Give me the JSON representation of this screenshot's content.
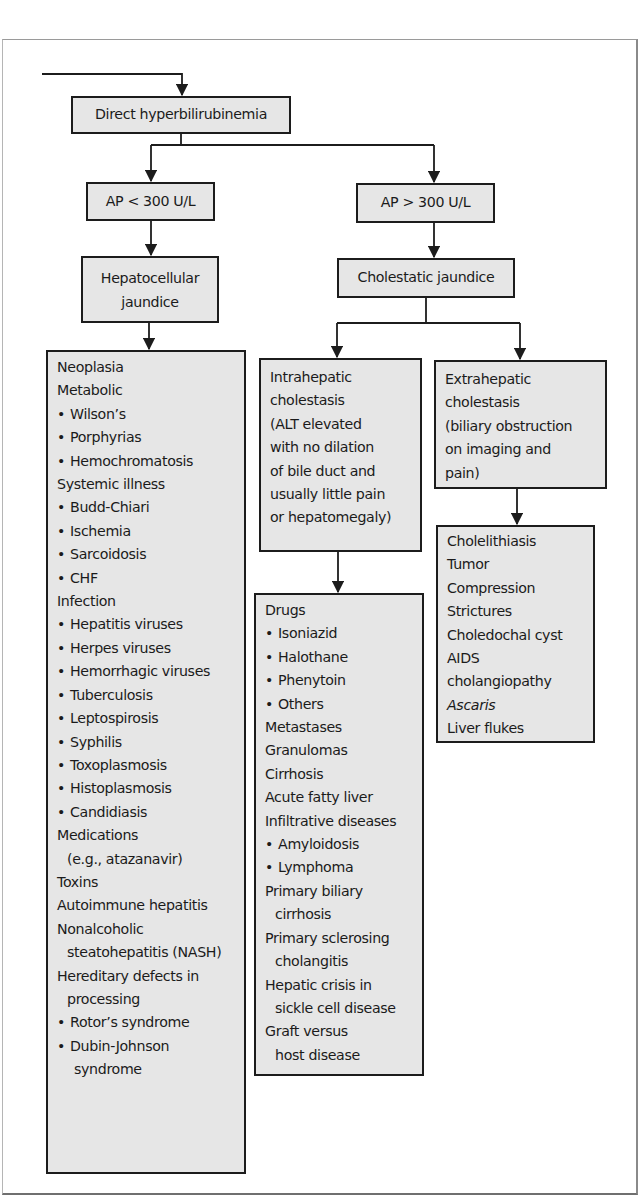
{
  "diagram": {
    "type": "flowchart",
    "root": {
      "label": "Direct hyperbilirubinemia"
    },
    "branches": [
      {
        "condition": "AP < 300 U/L",
        "result": "Hepatocellular jaundice",
        "result_lines": [
          "Hepatocellular",
          "jaundice"
        ],
        "causes": [
          {
            "text": "Neoplasia",
            "style": "heading"
          },
          {
            "text": "Metabolic",
            "style": "heading"
          },
          {
            "text": "Wilson’s",
            "style": "bullet"
          },
          {
            "text": "Porphyrias",
            "style": "bullet"
          },
          {
            "text": "Hemochromatosis",
            "style": "bullet"
          },
          {
            "text": "Systemic illness",
            "style": "heading"
          },
          {
            "text": "Budd-Chiari",
            "style": "bullet"
          },
          {
            "text": "Ischemia",
            "style": "bullet"
          },
          {
            "text": "Sarcoidosis",
            "style": "bullet"
          },
          {
            "text": "CHF",
            "style": "bullet"
          },
          {
            "text": "Infection",
            "style": "heading"
          },
          {
            "text": "Hepatitis viruses",
            "style": "bullet"
          },
          {
            "text": "Herpes viruses",
            "style": "bullet"
          },
          {
            "text": "Hemorrhagic viruses",
            "style": "bullet"
          },
          {
            "text": "Tuberculosis",
            "style": "bullet"
          },
          {
            "text": "Leptospirosis",
            "style": "bullet"
          },
          {
            "text": "Syphilis",
            "style": "bullet"
          },
          {
            "text": "Toxoplasmosis",
            "style": "bullet"
          },
          {
            "text": "Histoplasmosis",
            "style": "bullet"
          },
          {
            "text": "Candidiasis",
            "style": "bullet"
          },
          {
            "text": "Medications",
            "style": "heading"
          },
          {
            "text": "(e.g., atazanavir)",
            "style": "indent"
          },
          {
            "text": "Toxins",
            "style": "heading"
          },
          {
            "text": "Autoimmune hepatitis",
            "style": "heading"
          },
          {
            "text": "Nonalcoholic",
            "style": "heading"
          },
          {
            "text": "steatohepatitis (NASH)",
            "style": "indent"
          },
          {
            "text": "Hereditary defects in",
            "style": "heading"
          },
          {
            "text": "processing",
            "style": "indent"
          },
          {
            "text": "Rotor’s syndrome",
            "style": "bullet"
          },
          {
            "text": "Dubin-Johnson",
            "style": "bullet"
          },
          {
            "text": "syndrome",
            "style": "indent2"
          }
        ]
      },
      {
        "condition": "AP > 300 U/L",
        "result": "Cholestatic jaundice",
        "sub_branches": [
          {
            "label_lines": [
              "Intrahepatic",
              "cholestasis",
              "(ALT elevated",
              "with no dilation",
              "of bile duct and",
              "usually little pain",
              "or hepatomegaly)"
            ],
            "causes": [
              {
                "text": "Drugs",
                "style": "heading"
              },
              {
                "text": "Isoniazid",
                "style": "bullet"
              },
              {
                "text": "Halothane",
                "style": "bullet"
              },
              {
                "text": "Phenytoin",
                "style": "bullet"
              },
              {
                "text": "Others",
                "style": "bullet"
              },
              {
                "text": "Metastases",
                "style": "heading"
              },
              {
                "text": "Granulomas",
                "style": "heading"
              },
              {
                "text": "Cirrhosis",
                "style": "heading"
              },
              {
                "text": "Acute fatty liver",
                "style": "heading"
              },
              {
                "text": "Infiltrative diseases",
                "style": "heading"
              },
              {
                "text": "Amyloidosis",
                "style": "bullet"
              },
              {
                "text": "Lymphoma",
                "style": "bullet"
              },
              {
                "text": "Primary biliary",
                "style": "heading"
              },
              {
                "text": "cirrhosis",
                "style": "indent"
              },
              {
                "text": "Primary sclerosing",
                "style": "heading"
              },
              {
                "text": "cholangitis",
                "style": "indent"
              },
              {
                "text": "Hepatic crisis in",
                "style": "heading"
              },
              {
                "text": "sickle cell disease",
                "style": "indent"
              },
              {
                "text": "Graft versus",
                "style": "heading"
              },
              {
                "text": "host disease",
                "style": "indent"
              }
            ]
          },
          {
            "label_lines": [
              "Extrahepatic",
              "cholestasis",
              "(biliary obstruction",
              "on imaging and",
              "pain)"
            ],
            "causes": [
              {
                "text": "Cholelithiasis",
                "style": "heading"
              },
              {
                "text": "Tumor",
                "style": "heading"
              },
              {
                "text": "Compression",
                "style": "heading"
              },
              {
                "text": "Strictures",
                "style": "heading"
              },
              {
                "text": "Choledochal cyst",
                "style": "heading"
              },
              {
                "text": "AIDS",
                "style": "heading"
              },
              {
                "text": "cholangiopathy",
                "style": "heading"
              },
              {
                "text": "Ascaris",
                "style": "italic"
              },
              {
                "text": "Liver flukes",
                "style": "heading"
              }
            ]
          }
        ]
      }
    ],
    "colors": {
      "box_fill": "#e6e6e6",
      "box_border": "#1c1c1c",
      "background": "#ffffff",
      "connector": "#1c1c1c"
    }
  }
}
